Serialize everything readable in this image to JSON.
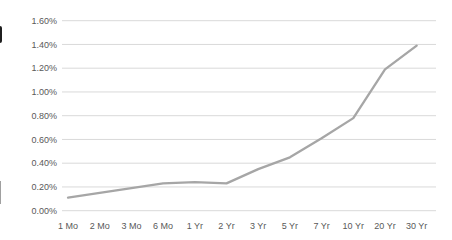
{
  "page": {
    "background": "#ffffff",
    "title": ""
  },
  "chart_data": {
    "type": "line",
    "title": "",
    "xlabel": "",
    "ylabel": "",
    "categories": [
      "1 Mo",
      "2 Mo",
      "3 Mo",
      "6 Mo",
      "1 Yr",
      "2 Yr",
      "3 Yr",
      "5 Yr",
      "7 Yr",
      "10 Yr",
      "20 Yr",
      "30 Yr"
    ],
    "series": [
      {
        "name": "yield-curve",
        "values": [
          0.11,
          0.15,
          0.19,
          0.23,
          0.24,
          0.23,
          0.35,
          0.45,
          0.61,
          0.78,
          1.19,
          1.39
        ]
      }
    ],
    "value_unit": "%",
    "ylim": [
      0.0,
      1.6
    ],
    "ytick_step": 0.2,
    "ytick_labels": [
      "0.00%",
      "0.20%",
      "0.40%",
      "0.60%",
      "0.80%",
      "1.00%",
      "1.20%",
      "1.40%",
      "1.60%"
    ],
    "grid": "horizontal",
    "legend": "none",
    "colors": {
      "line": "#a6a6a6",
      "gridline": "#d9d9d9",
      "tick_label": "#595959",
      "background": "#ffffff"
    }
  }
}
